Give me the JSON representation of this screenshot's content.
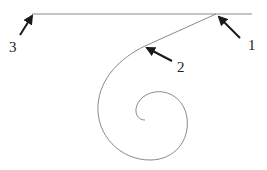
{
  "diagram": {
    "type": "geometric-curve",
    "colors": {
      "line": "#8a8a8a",
      "arrow": "#1a1a1a",
      "text": "#222222",
      "background": "#ffffff"
    },
    "labels": [
      {
        "id": "1",
        "text": "1",
        "x": 248,
        "y": 38
      },
      {
        "id": "2",
        "text": "2",
        "x": 177,
        "y": 60
      },
      {
        "id": "3",
        "text": "3",
        "x": 9,
        "y": 40
      }
    ],
    "arrows": [
      {
        "label": "1",
        "from": [
          240,
          38
        ],
        "to": [
          219,
          17
        ]
      },
      {
        "label": "2",
        "from": [
          172,
          61
        ],
        "to": [
          147,
          48
        ]
      },
      {
        "label": "3",
        "from": [
          20,
          35
        ],
        "to": [
          32,
          15
        ]
      }
    ]
  }
}
